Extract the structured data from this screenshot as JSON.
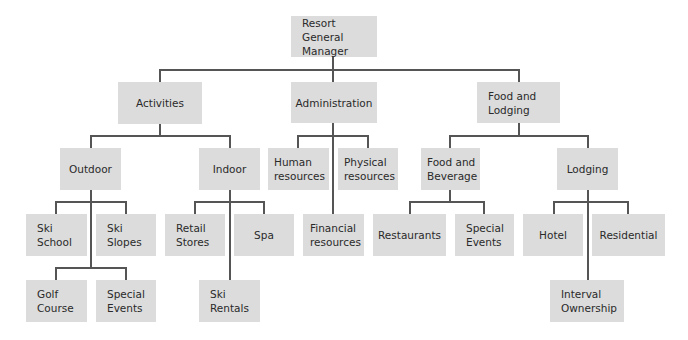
{
  "diagram": {
    "type": "organizational-chart",
    "colors": {
      "box_fill": "#dcdcdc",
      "line": "#555555",
      "text": "#2a2a2a",
      "background": "#ffffff"
    },
    "nodes": {
      "root": "Resort General\nManager",
      "activities": "Activities",
      "administration": "Administration",
      "food_lodging": "Food and\nLodging",
      "outdoor": "Outdoor",
      "indoor": "Indoor",
      "human_resources": "Human\nresources",
      "physical_resources": "Physical\nresources",
      "food_beverage": "Food and\nBeverage",
      "lodging": "Lodging",
      "ski_school": "Ski\nSchool",
      "ski_slopes": "Ski\nSlopes",
      "retail_stores": "Retail\nStores",
      "spa": "Spa",
      "financial_resources": "Financial\nresources",
      "restaurants": "Restaurants",
      "special_events_fb": "Special\nEvents",
      "hotel": "Hotel",
      "residential": "Residential",
      "golf_course": "Golf\nCourse",
      "special_events_outdoor": "Special\nEvents",
      "ski_rentals": "Ski\nRentals",
      "interval_ownership": "Interval\nOwnership"
    },
    "hierarchy": {
      "Resort General Manager": [
        "Activities",
        "Administration",
        "Food and Lodging"
      ],
      "Activities": [
        "Outdoor",
        "Indoor"
      ],
      "Outdoor": [
        "Ski School",
        "Ski Slopes",
        "Golf Course",
        "Special Events"
      ],
      "Indoor": [
        "Retail Stores",
        "Spa",
        "Ski Rentals"
      ],
      "Administration": [
        "Human resources",
        "Physical resources",
        "Financial resources"
      ],
      "Food and Lodging": [
        "Food and Beverage",
        "Lodging"
      ],
      "Food and Beverage": [
        "Restaurants",
        "Special Events"
      ],
      "Lodging": [
        "Hotel",
        "Residential",
        "Interval Ownership"
      ]
    }
  }
}
